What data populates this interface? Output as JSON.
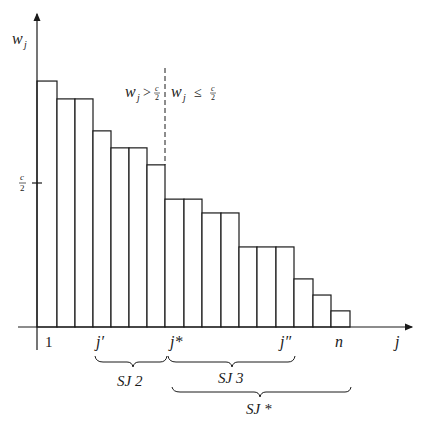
{
  "chart_data": {
    "type": "bar",
    "title": "",
    "ylabel": "w_j",
    "xlabel": "j",
    "unit_note": "bar heights expressed in units of c (capacity); reference tick at c/2",
    "categories": [
      "1",
      "2",
      "3",
      "4",
      "5",
      "6",
      "7",
      "8",
      "9",
      "10",
      "11",
      "12",
      "13",
      "14",
      "15",
      "16",
      "17"
    ],
    "values": [
      0.854,
      0.792,
      0.792,
      0.681,
      0.622,
      0.622,
      0.563,
      0.444,
      0.444,
      0.396,
      0.396,
      0.278,
      0.278,
      0.278,
      0.167,
      0.111,
      0.056
    ],
    "ylim": [
      0,
      1.05
    ],
    "y_reference": {
      "value": 0.5,
      "label_num": "c",
      "label_den": "2"
    },
    "x_tick_labels": [
      {
        "index": 1,
        "label": "1"
      },
      {
        "index": 4,
        "label": "j′"
      },
      {
        "index": 8,
        "label": "j*"
      },
      {
        "index": 14,
        "label": "j″"
      },
      {
        "index": 17,
        "label": "n"
      }
    ],
    "x_axis_end_label": "j",
    "divider": {
      "after_index": 7,
      "left_label": "w_j > c/2",
      "right_label": "w_j ≤ c/2"
    },
    "groups": [
      {
        "name": "SJ 2",
        "from_index": 4,
        "to_index": 8
      },
      {
        "name": "SJ 3",
        "from_index": 8,
        "to_index": 14
      },
      {
        "name": "SJ *",
        "from_index": 8,
        "to_index": 17
      }
    ]
  },
  "labels": {
    "y_axis": "w",
    "y_axis_sub": "j",
    "x_axis": "j",
    "ref_num": "c",
    "ref_den": "2",
    "left_w": "w",
    "left_sub": "j",
    "left_op": ">",
    "right_w": "w",
    "right_sub": "j",
    "right_op": "≤",
    "tick_1": "1",
    "tick_jprime": "j′",
    "tick_jstar": "j*",
    "tick_jdprime": "j″",
    "tick_n": "n",
    "sj2": "SJ 2",
    "sj3": "SJ 3",
    "sjstar": "SJ *"
  }
}
